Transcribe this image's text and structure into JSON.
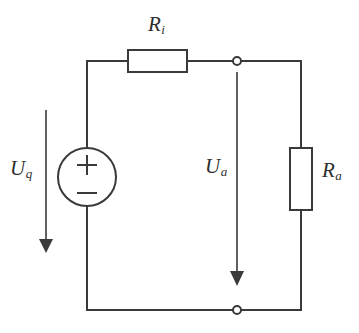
{
  "diagram": {
    "background_color": "#ffffff",
    "line_color": "#3a3a3a",
    "text_color": "#2e2e2e"
  },
  "labels": {
    "internal_resistor": {
      "symbol": "R",
      "subscript": "i",
      "full": "Ri"
    },
    "load_resistor": {
      "symbol": "R",
      "subscript": "a",
      "full": "Ra"
    },
    "source_voltage": {
      "symbol": "U",
      "subscript": "q",
      "full": "Uq"
    },
    "output_voltage": {
      "symbol": "U",
      "subscript": "a",
      "full": "Ua"
    }
  },
  "components": {
    "voltage_source": {
      "name": "voltage-source",
      "shape": "circle",
      "plus_sign": "+",
      "minus_sign": "−"
    },
    "internal_resistor": {
      "name": "resistor-ri",
      "shape": "rectangle",
      "orientation": "horizontal"
    },
    "load_resistor": {
      "name": "resistor-ra",
      "shape": "rectangle",
      "orientation": "vertical"
    },
    "nodes": [
      {
        "name": "terminal-node-top",
        "shape": "open-circle"
      },
      {
        "name": "terminal-node-bottom",
        "shape": "open-circle"
      }
    ],
    "arrows": [
      {
        "name": "voltage-arrow-uq",
        "direction": "down"
      },
      {
        "name": "voltage-arrow-ua",
        "direction": "down"
      }
    ]
  }
}
